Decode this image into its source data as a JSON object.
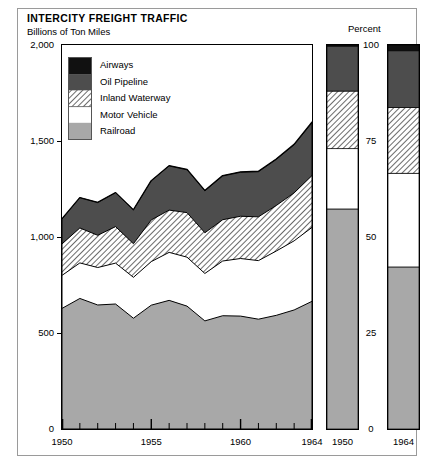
{
  "title": "INTERCITY FREIGHT TRAFFIC",
  "subtitle": "Billions of Ton Miles",
  "legend": {
    "items": [
      {
        "label": "Airways",
        "key": "airways",
        "fill": "#111111"
      },
      {
        "label": "Oil Pipeline",
        "key": "oil",
        "fill": "#4d4d4d"
      },
      {
        "label": "Inland Waterway",
        "key": "waterway",
        "fill": "hatch-diagonal"
      },
      {
        "label": "Motor Vehicle",
        "key": "motor",
        "fill": "#ffffff"
      },
      {
        "label": "Railroad",
        "key": "railroad",
        "fill": "#a8a8a8"
      }
    ]
  },
  "percent_panel": {
    "axis_title": "Percent",
    "axis_ticks": [
      "100",
      "75",
      "50",
      "25",
      "0"
    ],
    "bars": [
      {
        "label": "1950"
      },
      {
        "label": "1964"
      }
    ]
  },
  "chart_data": {
    "type": "area",
    "title": "INTERCITY FREIGHT TRAFFIC",
    "subtitle": "Billions of Ton Miles",
    "xlabel": "",
    "ylabel": "Billions of Ton Miles",
    "stacked": true,
    "grid": false,
    "legend_position": "inside-top-left",
    "xlim": [
      1950,
      1964
    ],
    "ylim": [
      0,
      2000
    ],
    "ytick_labels": [
      "0",
      "500",
      "1,000",
      "1,500",
      "2,000"
    ],
    "ytick_values": [
      0,
      500,
      1000,
      1500,
      2000
    ],
    "xtick_labels": [
      "1950",
      "1955",
      "1960",
      "1964"
    ],
    "xtick_values": [
      1950,
      1955,
      1960,
      1964
    ],
    "x": [
      1950,
      1951,
      1952,
      1953,
      1954,
      1955,
      1956,
      1957,
      1958,
      1959,
      1960,
      1961,
      1962,
      1963,
      1964
    ],
    "series": [
      {
        "name": "Railroad",
        "fill": "#a8a8a8",
        "values": [
          628,
          680,
          646,
          651,
          577,
          645,
          670,
          640,
          563,
          590,
          588,
          572,
          592,
          620,
          665
        ]
      },
      {
        "name": "Motor Vehicle",
        "fill": "#ffffff",
        "values": [
          172,
          185,
          195,
          213,
          213,
          227,
          250,
          255,
          247,
          285,
          300,
          305,
          335,
          360,
          385
        ]
      },
      {
        "name": "Inland Waterway",
        "fill": "hatch-diagonal",
        "values": [
          164,
          182,
          168,
          190,
          175,
          217,
          220,
          232,
          212,
          215,
          220,
          228,
          237,
          250,
          270
        ]
      },
      {
        "name": "Oil Pipeline",
        "fill": "#4d4d4d",
        "values": [
          129,
          157,
          170,
          176,
          175,
          203,
          230,
          223,
          218,
          228,
          229,
          235,
          240,
          250,
          275
        ]
      },
      {
        "name": "Airways",
        "fill": "#111111",
        "values": [
          0.3,
          0.4,
          0.5,
          0.6,
          0.7,
          0.8,
          0.9,
          1.0,
          1.1,
          1.3,
          1.5,
          1.7,
          2.0,
          2.4,
          2.8
        ]
      }
    ],
    "percent_bars": {
      "ylabel": "Percent",
      "ylim": [
        0,
        100
      ],
      "ytick_labels": [
        "0",
        "25",
        "50",
        "75",
        "100"
      ],
      "categories": [
        "1950",
        "1964"
      ],
      "series": [
        {
          "name": "Railroad",
          "fill": "#a8a8a8",
          "values": [
            57.3,
            42.2
          ]
        },
        {
          "name": "Motor Vehicle",
          "fill": "#ffffff",
          "values": [
            15.7,
            24.4
          ]
        },
        {
          "name": "Inland Waterway",
          "fill": "hatch-diagonal",
          "values": [
            15.0,
            17.1
          ]
        },
        {
          "name": "Oil Pipeline",
          "fill": "#4d4d4d",
          "values": [
            11.8,
            14.8
          ]
        },
        {
          "name": "Airways",
          "fill": "#111111",
          "values": [
            0.2,
            1.5
          ]
        }
      ]
    }
  }
}
